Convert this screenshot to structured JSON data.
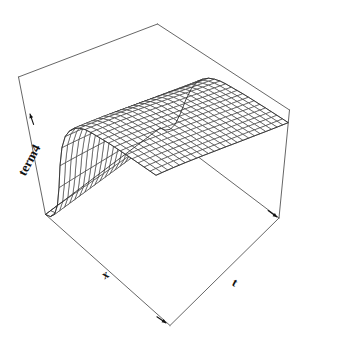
{
  "figure": {
    "title": "",
    "background_color": "#ffffff",
    "line_color": "#2b2b2b",
    "box_color": "#555555",
    "width": 340,
    "height": 340
  },
  "axes": {
    "x_axis": {
      "name": "x-axis",
      "label": "x",
      "label_position": "bottom-left",
      "arrow": true,
      "ticks": [],
      "tick_labels": []
    },
    "t_axis": {
      "name": "t-axis",
      "label": "t",
      "label_position": "bottom-right",
      "arrow": true,
      "ticks": [],
      "tick_labels": []
    },
    "z_axis": {
      "name": "z-axis",
      "label": "term4",
      "label_position": "left",
      "arrow": true,
      "ticks": [],
      "tick_labels": []
    }
  },
  "chart_data": {
    "type": "surface",
    "title": "",
    "xlabel": "x",
    "ylabel": "t",
    "zlabel": "term4",
    "grid": true,
    "legend": "none",
    "projection": "perspective",
    "style": "wireframe-mesh",
    "x": [
      0,
      0.0435,
      0.087,
      0.1304,
      0.1739,
      0.2174,
      0.2609,
      0.3043,
      0.3478,
      0.3913,
      0.4348,
      0.4783,
      0.5217,
      0.5652,
      0.6087,
      0.6522,
      0.6957,
      0.7391,
      0.7826,
      0.8261,
      0.8696,
      0.913,
      0.9565,
      1.0
    ],
    "t": [
      0,
      0.0435,
      0.087,
      0.1304,
      0.1739,
      0.2174,
      0.2609,
      0.3043,
      0.3478,
      0.3913,
      0.4348,
      0.4783,
      0.5217,
      0.5652,
      0.6087,
      0.6522,
      0.6957,
      0.7391,
      0.7826,
      0.8261,
      0.8696,
      0.913,
      0.9565,
      1.0
    ],
    "xlim": [
      0,
      1
    ],
    "tlim": [
      0,
      1
    ],
    "zlim": [
      0,
      1
    ],
    "surface_description": "Surface is near zero at small x and rises steeply, saturating to a plateau near 1 for x greater than about 0.25; nearly independent of t with a mild decline toward large t.",
    "z_profile_vs_x": [
      0.0,
      0.02,
      0.07,
      0.17,
      0.33,
      0.52,
      0.68,
      0.79,
      0.86,
      0.91,
      0.94,
      0.96,
      0.97,
      0.975,
      0.98,
      0.985,
      0.988,
      0.99,
      0.992,
      0.994,
      0.995,
      0.996,
      0.997,
      0.998
    ],
    "t_attenuation": [
      1.0,
      0.999,
      0.997,
      0.995,
      0.992,
      0.989,
      0.985,
      0.981,
      0.977,
      0.972,
      0.967,
      0.962,
      0.957,
      0.951,
      0.945,
      0.939,
      0.933,
      0.927,
      0.92,
      0.913,
      0.906,
      0.899,
      0.892,
      0.885
    ],
    "n_x_lines": 24,
    "n_t_lines": 24
  }
}
